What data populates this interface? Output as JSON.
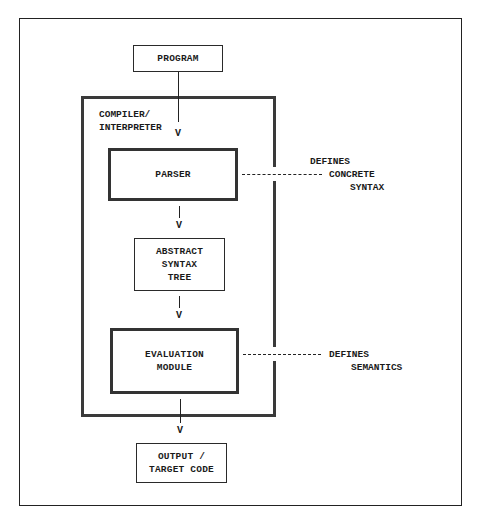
{
  "diagram": {
    "nodes": {
      "program": {
        "label": "PROGRAM"
      },
      "compiler": {
        "label": "COMPILER/\nINTERPRETER"
      },
      "parser": {
        "label": "PARSER"
      },
      "ast": {
        "label": "ABSTRACT\nSYNTAX\nTREE"
      },
      "evaluation": {
        "label": "EVALUATION\nMODULE"
      },
      "output": {
        "label": "OUTPUT /\nTARGET CODE"
      }
    },
    "arrows": {
      "arrowhead": "V"
    },
    "annotations": {
      "concrete_syntax": {
        "line1": "DEFINES",
        "line2": "CONCRETE",
        "line3": "SYNTAX"
      },
      "semantics": {
        "line1": "DEFINES",
        "line2": "SEMANTICS"
      }
    },
    "edges": [
      {
        "from": "PROGRAM",
        "to": "PARSER",
        "style": "arrow"
      },
      {
        "from": "PARSER",
        "to": "ABSTRACT SYNTAX TREE",
        "style": "arrow"
      },
      {
        "from": "ABSTRACT SYNTAX TREE",
        "to": "EVALUATION MODULE",
        "style": "arrow"
      },
      {
        "from": "EVALUATION MODULE",
        "to": "OUTPUT / TARGET CODE",
        "style": "arrow"
      },
      {
        "from": "PARSER",
        "to": "DEFINES CONCRETE SYNTAX",
        "style": "dashed"
      },
      {
        "from": "EVALUATION MODULE",
        "to": "DEFINES SEMANTICS",
        "style": "dashed"
      }
    ]
  }
}
